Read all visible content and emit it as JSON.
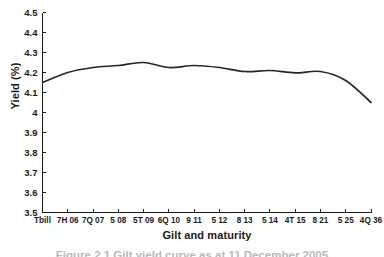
{
  "chart_data": {
    "type": "line",
    "title": "",
    "subtitle": "",
    "xlabel": "Gilt and maturity",
    "ylabel": "Yield (%)",
    "ylim": [
      3.5,
      4.5
    ],
    "ytick_values": [
      3.5,
      3.6,
      3.7,
      3.8,
      3.9,
      4.0,
      4.1,
      4.2,
      4.3,
      4.4,
      4.5
    ],
    "ytick_labels": [
      "3.5",
      "3.6",
      "3.7",
      "3.8",
      "3.9",
      "4",
      "4.1",
      "4.2",
      "4.3",
      "4.4",
      "4.5"
    ],
    "grid": false,
    "legend_position": "none",
    "legend_entries": [],
    "annotations": [],
    "categories": [
      "Tbill",
      "7H 06",
      "7Q 07",
      "5 08",
      "5T 09",
      "6Q 10",
      "9 11",
      "5 12",
      "8 13",
      "5 14",
      "4T 15",
      "8 21",
      "5 25",
      "4Q 36"
    ],
    "series": [
      {
        "name": "Gilt yield",
        "color": "#262626",
        "values": [
          4.15,
          4.2,
          4.225,
          4.235,
          4.25,
          4.225,
          4.235,
          4.225,
          4.205,
          4.21,
          4.198,
          4.205,
          4.16,
          4.05
        ]
      }
    ]
  },
  "figure": {
    "caption": "Figure 2.1 Gilt yield curve as at 11 December 2005"
  }
}
